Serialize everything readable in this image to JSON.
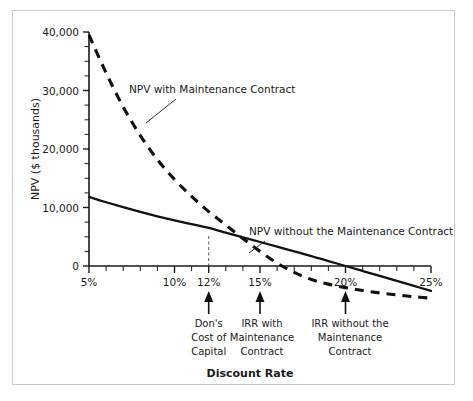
{
  "figure": {
    "background": "#ffffff",
    "border_color": "#c8c8c8"
  },
  "chart_data": {
    "type": "line",
    "title": "",
    "xlabel": "Discount Rate",
    "ylabel": "NPV ($ thousands)",
    "xlim": [
      5,
      25
    ],
    "ylim": [
      -6000,
      40000
    ],
    "grid": false,
    "legend_position": "inline-annotations",
    "x_tick_labels": [
      "5%",
      "10%",
      "12%",
      "15%",
      "20%",
      "25%"
    ],
    "x_tick_values": [
      5,
      10,
      12,
      15,
      20,
      25
    ],
    "x_minor_tick_values": [
      6,
      7,
      8,
      9,
      11,
      13,
      14,
      16,
      17,
      18,
      19,
      21,
      22,
      23,
      24
    ],
    "y_tick_labels": [
      "0",
      "10,000",
      "20,000",
      "30,000",
      "40,000"
    ],
    "y_tick_values": [
      0,
      10000,
      20000,
      30000,
      40000
    ],
    "y_minor_tick_values": [
      2500,
      5000,
      7500,
      12500,
      15000,
      17500,
      22500,
      25000,
      27500,
      32500,
      35000,
      37500
    ],
    "series": [
      {
        "name": "NPV with Maintenance Contract",
        "style": "dashed",
        "color": "#111111",
        "x": [
          5,
          6,
          7,
          8,
          9,
          10,
          11,
          12,
          13,
          14,
          15,
          16,
          17,
          18,
          19,
          20,
          21,
          22,
          23,
          24,
          25
        ],
        "values": [
          39500,
          33000,
          27200,
          22300,
          18200,
          14800,
          11900,
          9300,
          7000,
          4700,
          2500,
          500,
          -1100,
          -2300,
          -3100,
          -3700,
          -4200,
          -4600,
          -4950,
          -5250,
          -5500
        ]
      },
      {
        "name": "NPV without the Maintenance Contract",
        "style": "solid",
        "color": "#111111",
        "x": [
          5,
          6,
          7,
          8,
          9,
          10,
          11,
          12,
          13,
          14,
          15,
          16,
          17,
          18,
          19,
          20,
          21,
          22,
          23,
          24,
          25
        ],
        "values": [
          11800,
          10900,
          10050,
          9250,
          8500,
          7800,
          7150,
          6500,
          5700,
          4900,
          4100,
          3300,
          2500,
          1700,
          850,
          0,
          -850,
          -1700,
          -2550,
          -3400,
          -4250
        ]
      }
    ],
    "annotations": [
      {
        "id": "dons-cost-of-capital",
        "x_value": 12,
        "lines": [
          "Don's",
          "Cost of",
          "Capital"
        ],
        "marker": "up-arrow",
        "dashed_drop_line": true
      },
      {
        "id": "irr-with-maintenance-contract",
        "x_value": 15,
        "lines": [
          "IRR with",
          "Maintenance",
          "Contract"
        ],
        "marker": "up-arrow",
        "dashed_drop_line": false
      },
      {
        "id": "irr-without-the-maintenance-contract",
        "x_value": 20,
        "lines": [
          "IRR without the",
          "Maintenance",
          "Contract"
        ],
        "marker": "up-arrow",
        "dashed_drop_line": false
      }
    ],
    "series_callouts": [
      {
        "id": "callout-with-contract",
        "text": "NPV with Maintenance Contract",
        "text_x": 116,
        "text_y": 82,
        "leader_from": [
          163,
          88
        ],
        "leader_to": [
          133,
          112
        ]
      },
      {
        "id": "callout-without-contract",
        "text": "NPV without the Maintenance Contract",
        "text_x": 236,
        "text_y": 224,
        "leader_from": [
          252,
          230
        ],
        "leader_to": [
          236,
          242
        ]
      }
    ]
  }
}
